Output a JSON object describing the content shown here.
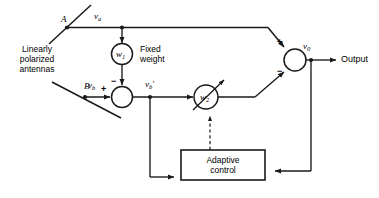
{
  "diagram": {
    "background_color": "#ffffff",
    "line_color": "#1a1a1a",
    "antennas_label": {
      "line1": "Linearly",
      "line2": "polarized",
      "line3": "antennas"
    },
    "antenna_a_label": "A",
    "antenna_b_label": "B",
    "signals": {
      "v_a": "v",
      "v_a_sub": "a",
      "v_b": "v",
      "v_b_sub": "b",
      "v_b_prime": "v",
      "v_b_prime_sub": "b",
      "v_b_prime_mark": "'",
      "v_0": "v",
      "v_0_sub": "0"
    },
    "weights": {
      "fixed_weight_symbol": "w",
      "fixed_weight_sub": "1",
      "fixed_weight_label_line1": "Fixed",
      "fixed_weight_label_line2": "weight",
      "adaptive_weight_symbol": "w",
      "adaptive_weight_sub": "2"
    },
    "adaptive_control": {
      "line1": "Adaptive",
      "line2": "control"
    },
    "output_label": "Output",
    "signs": {
      "sum1_minus": "−",
      "sum1_plus": "+",
      "sum2_plus": "+",
      "sum2_minus": "−"
    }
  }
}
